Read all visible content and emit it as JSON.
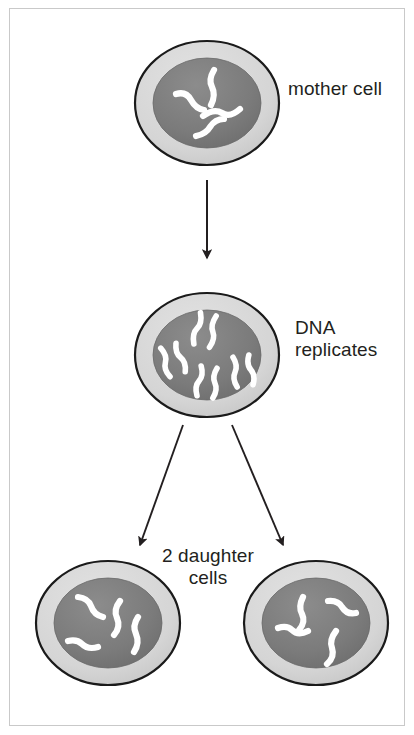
{
  "diagram": {
    "background_color": "#ffffff",
    "frame_color": "#c9c9c9",
    "text_color": "#231f20",
    "cell_outline_color": "#1a1a1a",
    "cytoplasm_color": "#d4d4d4",
    "nucleus_color": "#7a7a7a",
    "chromosome_color": "#ffffff",
    "arrow_color": "#231f20"
  },
  "labels": {
    "mother_cell": "mother cell",
    "dna_replicates": "DNA\nreplicates",
    "daughter_cells": "2 daughter\ncells"
  },
  "stages": [
    {
      "id": "mother-cell",
      "label": "mother cell",
      "chromosome_type": "unreplicated-squiggle",
      "chromosome_count": 4,
      "cx": 207,
      "cy": 103,
      "rx": 72,
      "ry": 62
    },
    {
      "id": "replicated-cell",
      "label": "DNA replicates",
      "chromosome_type": "replicated-x",
      "chromosome_count": 4,
      "cx": 207,
      "cy": 355,
      "rx": 72,
      "ry": 62
    },
    {
      "id": "daughter-cell-left",
      "label": "2 daughter cells",
      "chromosome_type": "unreplicated-squiggle",
      "chromosome_count": 4,
      "cx": 108,
      "cy": 623,
      "rx": 72,
      "ry": 62
    },
    {
      "id": "daughter-cell-right",
      "label": "2 daughter cells",
      "chromosome_type": "unreplicated-squiggle",
      "chromosome_count": 4,
      "cx": 316,
      "cy": 623,
      "rx": 72,
      "ry": 62
    }
  ],
  "arrows": [
    {
      "id": "arrow-mother-to-replicated",
      "from": "mother-cell",
      "to": "replicated-cell",
      "direction": "down"
    },
    {
      "id": "arrow-replicated-to-daughter-left",
      "from": "replicated-cell",
      "to": "daughter-cell-left",
      "direction": "down-left"
    },
    {
      "id": "arrow-replicated-to-daughter-right",
      "from": "replicated-cell",
      "to": "daughter-cell-right",
      "direction": "down-right"
    }
  ]
}
